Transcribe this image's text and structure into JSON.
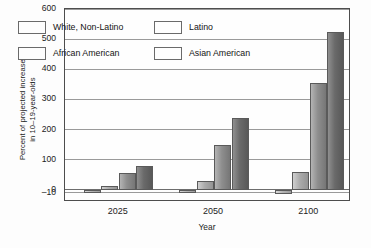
{
  "chart_data": {
    "type": "bar",
    "title": "",
    "xlabel": "Year",
    "ylabel": "Percent of projected increase\nin 10–19-year-olds",
    "categories": [
      "2025",
      "2050",
      "2100"
    ],
    "series": [
      {
        "name": "White, Non-Latino",
        "values": [
          -10,
          -10,
          -12
        ]
      },
      {
        "name": "Latino",
        "values": [
          12,
          30,
          60
        ]
      },
      {
        "name": "African American",
        "values": [
          55,
          150,
          355
        ]
      },
      {
        "name": "Asian American",
        "values": [
          78,
          240,
          525
        ]
      }
    ],
    "yticks": [
      600,
      500,
      400,
      300,
      200,
      100,
      0,
      -10
    ],
    "ylim": [
      -10,
      600
    ],
    "grid": true,
    "legend_position": "top-left-inside"
  },
  "axis": {
    "y_title": "Percent of projected increase\nin 10–19-year-olds",
    "x_title": "Year"
  },
  "legend": {
    "items": [
      {
        "label": "White, Non-Latino",
        "swatch": "gray-light"
      },
      {
        "label": "Latino",
        "swatch": "gray-light-2"
      },
      {
        "label": "African American",
        "swatch": "gray-mid"
      },
      {
        "label": "Asian American",
        "swatch": "gray-dark"
      }
    ]
  },
  "colors": {
    "series_0": "#b4b4b4",
    "series_1": "#ababab",
    "series_2": "#8e8e8e",
    "series_3": "#6a6a6a",
    "frame": "#4d4d4d",
    "grid": "#9a9a9a",
    "background": "#fdfdfd"
  }
}
